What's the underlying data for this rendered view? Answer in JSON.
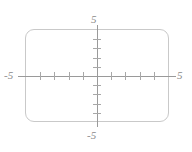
{
  "figure": {
    "name": "coordinate-plane-viewing-window",
    "background_color": "#ffffff",
    "frame_color": "#c9c9c9",
    "axis_color": "#9a9a9a",
    "tick_color": "#a8a8a8",
    "label_color": "#8a8a8a"
  },
  "labels": {
    "top": "5",
    "bottom": "-5",
    "left": "-5",
    "right": "5"
  },
  "chart_data": {
    "type": "scatter",
    "title": "",
    "subtitle": "",
    "xlabel": "",
    "ylabel": "",
    "xlim": [
      -5,
      5
    ],
    "ylim": [
      -5,
      5
    ],
    "xticks": [
      -4,
      -3,
      -2,
      -1,
      1,
      2,
      3,
      4
    ],
    "yticks": [
      -4,
      -3,
      -2,
      -1,
      1,
      2,
      3,
      4
    ],
    "xtick_labels": [
      "",
      "",
      "",
      "",
      "",
      "",
      "",
      ""
    ],
    "ytick_labels": [
      "",
      "",
      "",
      "",
      "",
      "",
      "",
      ""
    ],
    "x_axis_end_labels": [
      "-5",
      "5"
    ],
    "y_axis_end_labels": [
      "-5",
      "5"
    ],
    "tick_interval": 1,
    "grid": false,
    "legend": null,
    "series": [],
    "x": [],
    "y": [],
    "annotations": []
  }
}
